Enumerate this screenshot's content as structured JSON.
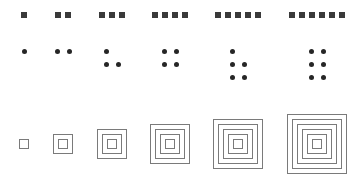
{
  "diagram": {
    "title": "",
    "colors": {
      "square": "#3a3a3a",
      "dot": "#262626",
      "frame": "#7a7a7a",
      "background": "#ffffff"
    },
    "columns": [
      {
        "index": 1,
        "center_x": 24
      },
      {
        "index": 2,
        "center_x": 63
      },
      {
        "index": 3,
        "center_x": 112
      },
      {
        "index": 4,
        "center_x": 170
      },
      {
        "index": 5,
        "center_x": 238
      },
      {
        "index": 6,
        "center_x": 317
      }
    ],
    "rows": [
      {
        "name": "filled-squares",
        "y": 12,
        "counts": [
          1,
          2,
          3,
          4,
          5,
          6
        ],
        "square_size": 6,
        "spacing": 10
      },
      {
        "name": "dots",
        "line_y": [
          51,
          64,
          77
        ],
        "line_spacing_x": 12,
        "patterns": [
          [
            1
          ],
          [
            2
          ],
          [
            1,
            2
          ],
          [
            2,
            2
          ],
          [
            1,
            2,
            2
          ],
          [
            2,
            2,
            2
          ]
        ]
      },
      {
        "name": "nested-squares",
        "center_y": 144,
        "counts": [
          1,
          2,
          3,
          4,
          5,
          6
        ],
        "inner_size": 10,
        "step_per_side": 5
      }
    ]
  }
}
